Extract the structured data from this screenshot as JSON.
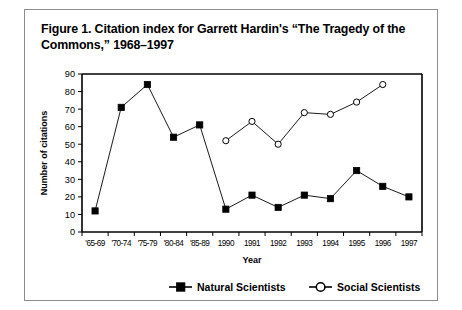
{
  "figure": {
    "caption": "Figure 1. Citation index for Garrett Hardin's “The Tragedy of the Commons,” 1968–1997"
  },
  "chart_data": {
    "type": "line",
    "title": "Figure 1. Citation index for Garrett Hardin's “The Tragedy of the Commons,” 1968–1997",
    "xlabel": "Year",
    "ylabel": "Number of citations",
    "categories": [
      "'65-69",
      "'70-74",
      "'75-79",
      "'80-84",
      "'85-89",
      "1990",
      "1991",
      "1992",
      "1993",
      "1994",
      "1995",
      "1996",
      "1997"
    ],
    "yticks": [
      0,
      10,
      20,
      30,
      40,
      50,
      60,
      70,
      80,
      90
    ],
    "ylim": [
      0,
      90
    ],
    "grid": false,
    "legend_position": "bottom",
    "series": [
      {
        "name": "Natural Scientists",
        "marker": "filled-square",
        "values": [
          12,
          71,
          84,
          54,
          61,
          13,
          21,
          14,
          21,
          19,
          35,
          26,
          20
        ]
      },
      {
        "name": "Social Scientists",
        "marker": "open-circle",
        "values": [
          null,
          null,
          null,
          null,
          null,
          52,
          63,
          50,
          68,
          67,
          74,
          84,
          null
        ]
      }
    ]
  },
  "legend": {
    "items": [
      {
        "label": "Natural Scientists",
        "marker": "filled-square"
      },
      {
        "label": "Social Scientists",
        "marker": "open-circle"
      }
    ]
  }
}
